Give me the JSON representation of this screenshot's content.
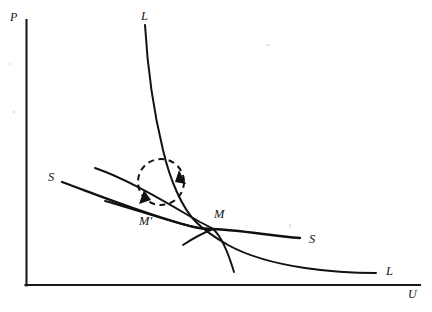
{
  "figure": {
    "type": "economic-diagram",
    "background_color": "#ffffff",
    "ink_color": "#111111"
  },
  "axes": {
    "vertical": {
      "label": "P",
      "x": 26,
      "y_top": 20,
      "y_bottom": 285
    },
    "horizontal": {
      "label": "U",
      "y": 285,
      "x_left": 26,
      "x_right": 420
    }
  },
  "curves": {
    "l_curve": {
      "label_top": "L",
      "label_right": "L",
      "kind": "convex-decreasing"
    },
    "s_line_upper": {
      "label_right": "S",
      "kind": "straight-decreasing"
    },
    "s_line_lower": {
      "label_left": "S",
      "kind": "straight-decreasing"
    }
  },
  "points": {
    "m": {
      "label": "M",
      "x": 212,
      "y": 228
    },
    "m_prime": {
      "label": "M'",
      "x": 145,
      "y": 222
    }
  },
  "annotation": {
    "circle": {
      "name": "adjustment-loop",
      "center_x": 161,
      "center_y": 182,
      "radius": 23,
      "style": "dashed",
      "direction": "clockwise",
      "arrow_count": 2
    }
  }
}
